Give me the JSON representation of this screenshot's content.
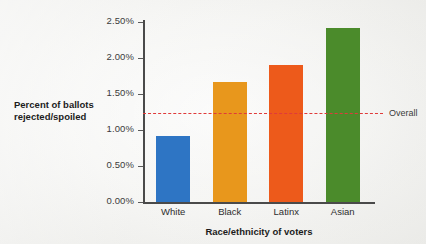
{
  "chart_data": {
    "type": "bar",
    "title": "",
    "xlabel": "Race/ethnicity of voters",
    "ylabel": "Percent of ballots rejected/spoiled",
    "ylabel_lines": [
      "Percent of ballots",
      "rejected/spoiled"
    ],
    "categories": [
      "White",
      "Black",
      "Latinx",
      "Asian"
    ],
    "values": [
      0.92,
      1.67,
      1.9,
      2.41
    ],
    "value_labels": [
      "0.92%",
      "1.67%",
      "1.90%",
      "2.41%"
    ],
    "bar_colors": [
      "#2e75c4",
      "#e8971c",
      "#ed5a1b",
      "#4b8b2b"
    ],
    "ylim": [
      0,
      2.5
    ],
    "ytick_values": [
      0.0,
      0.5,
      1.0,
      1.5,
      2.0,
      2.5
    ],
    "ytick_labels": [
      "0.00%",
      "0.50%",
      "1.00%",
      "1.50%",
      "2.00%",
      "2.50%"
    ],
    "grid": false,
    "legend": "none",
    "annotations": [
      {
        "name": "overall-reference-line",
        "label": "Overall",
        "value": 1.24,
        "style": "dashed",
        "color": "#e03a3a"
      }
    ],
    "background_color": "#f4f4f2",
    "axis_color": "#4a4a4a"
  }
}
